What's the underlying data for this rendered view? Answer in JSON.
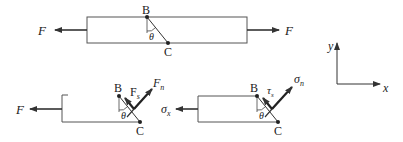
{
  "diagram": {
    "top_bar": {
      "left_force": "F",
      "right_force": "F",
      "point_b": "B",
      "point_c": "C",
      "angle": "θ"
    },
    "left_section": {
      "applied_force": "F",
      "point_b": "B",
      "point_c": "C",
      "angle": "θ",
      "shear_force": "F",
      "shear_sub": "s",
      "normal_force": "F",
      "normal_sub": "n"
    },
    "right_section": {
      "applied_stress": "σ",
      "applied_sub": "x",
      "point_b": "B",
      "point_c": "C",
      "angle": "θ",
      "shear_stress": "τ",
      "shear_sub": "s",
      "normal_stress": "σ",
      "normal_sub": "n"
    },
    "axes": {
      "x_label": "x",
      "y_label": "y"
    },
    "colors": {
      "line": "#333333",
      "background": "#ffffff"
    }
  }
}
